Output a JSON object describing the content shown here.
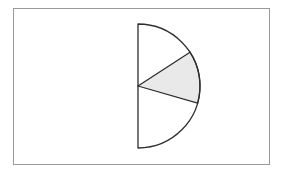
{
  "figure": {
    "background_color": "#ffffff",
    "frame": {
      "name": "figure-border",
      "x": 13.5,
      "y": 8.5,
      "width": 256,
      "height": 156,
      "stroke_color": "#9a9a9a",
      "stroke_width": 1,
      "fill_color": "#ffffff"
    },
    "semicircle": {
      "center_x": 138,
      "center_y": 86,
      "radius": 62,
      "diameter_orientation": "vertical",
      "bulge_direction": "right",
      "start_angle_deg": -90,
      "end_angle_deg": 90,
      "stroke_color": "#2e2e2e",
      "stroke_width": 1.3,
      "fill_color": "#ffffff",
      "top_point_x": 138,
      "top_point_y": 24,
      "bottom_point_x": 138,
      "bottom_point_y": 148,
      "rightmost_point_x": 200,
      "rightmost_point_y": 86
    },
    "shaded_sector": {
      "name": "shaded-sector",
      "fill_color": "#e9e9e9",
      "stroke_color": "#2e2e2e",
      "stroke_width": 1.3,
      "upper_radius_angle_deg": -33,
      "lower_radius_angle_deg": 16,
      "upper_endpoint_x": 176,
      "upper_endpoint_y": 52,
      "lower_endpoint_x": 194,
      "lower_endpoint_y": 103,
      "sweep_deg": 49
    },
    "unshaded_regions": [
      {
        "name": "upper-unshaded-sector",
        "fill_color": "#ffffff",
        "from_angle_deg": -90,
        "to_angle_deg": -33
      },
      {
        "name": "lower-unshaded-sector",
        "fill_color": "#ffffff",
        "from_angle_deg": 16,
        "to_angle_deg": 90
      }
    ],
    "labels": []
  }
}
